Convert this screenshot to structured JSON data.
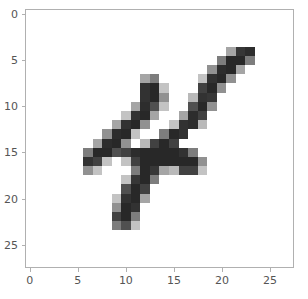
{
  "figure": {
    "background_color": "#ffffff",
    "axes_edge_color": "#b0b0b0",
    "tick_color": "#555555"
  },
  "chart_data": {
    "type": "heatmap",
    "title": "",
    "xlabel": "",
    "ylabel": "",
    "colormap": "gray_r",
    "origin": "upper",
    "grid": false,
    "legend": null,
    "interpolation": "nearest",
    "aspect": "equal",
    "vmin": 0,
    "vmax": 255,
    "shape": [
      28,
      28
    ],
    "xlim": [
      -0.5,
      27.5
    ],
    "ylim": [
      27.5,
      -0.5
    ],
    "xticks": [
      0,
      5,
      10,
      15,
      20,
      25
    ],
    "yticks": [
      0,
      5,
      10,
      15,
      20,
      25
    ],
    "xticklabels": [
      "0",
      "5",
      "10",
      "15",
      "20",
      "25"
    ],
    "yticklabels": [
      "0",
      "5",
      "10",
      "15",
      "20",
      "25"
    ],
    "values": [
      [
        0,
        0,
        0,
        0,
        0,
        0,
        0,
        0,
        0,
        0,
        0,
        0,
        0,
        0,
        0,
        0,
        0,
        0,
        0,
        0,
        0,
        0,
        0,
        0,
        0,
        0,
        0,
        0
      ],
      [
        0,
        0,
        0,
        0,
        0,
        0,
        0,
        0,
        0,
        0,
        0,
        0,
        0,
        0,
        0,
        0,
        0,
        0,
        0,
        0,
        0,
        0,
        0,
        0,
        0,
        0,
        0,
        0
      ],
      [
        0,
        0,
        0,
        0,
        0,
        0,
        0,
        0,
        0,
        0,
        0,
        0,
        0,
        0,
        0,
        0,
        0,
        0,
        0,
        0,
        0,
        0,
        0,
        0,
        0,
        0,
        0,
        0
      ],
      [
        0,
        0,
        0,
        0,
        0,
        0,
        0,
        0,
        0,
        0,
        0,
        0,
        0,
        0,
        0,
        0,
        0,
        0,
        0,
        0,
        0,
        0,
        0,
        0,
        0,
        0,
        0,
        0
      ],
      [
        0,
        0,
        0,
        0,
        0,
        0,
        0,
        0,
        0,
        0,
        0,
        0,
        0,
        0,
        0,
        0,
        0,
        0,
        0,
        0,
        0,
        90,
        200,
        210,
        0,
        0,
        0,
        0
      ],
      [
        0,
        0,
        0,
        0,
        0,
        0,
        0,
        0,
        0,
        0,
        0,
        0,
        0,
        0,
        0,
        0,
        0,
        0,
        0,
        0,
        130,
        215,
        215,
        130,
        0,
        0,
        0,
        0
      ],
      [
        0,
        0,
        0,
        0,
        0,
        0,
        0,
        0,
        0,
        0,
        0,
        0,
        0,
        0,
        0,
        0,
        0,
        0,
        0,
        110,
        210,
        215,
        90,
        0,
        0,
        0,
        0,
        0
      ],
      [
        0,
        0,
        0,
        0,
        0,
        0,
        0,
        0,
        0,
        0,
        0,
        0,
        90,
        130,
        0,
        0,
        0,
        0,
        60,
        205,
        215,
        110,
        0,
        0,
        0,
        0,
        0,
        0
      ],
      [
        0,
        0,
        0,
        0,
        0,
        0,
        0,
        0,
        0,
        0,
        0,
        0,
        205,
        215,
        60,
        0,
        0,
        0,
        190,
        215,
        110,
        0,
        0,
        0,
        0,
        0,
        0,
        0
      ],
      [
        0,
        0,
        0,
        0,
        0,
        0,
        0,
        0,
        0,
        0,
        0,
        0,
        205,
        215,
        110,
        0,
        0,
        70,
        205,
        200,
        0,
        0,
        0,
        0,
        0,
        0,
        0,
        0
      ],
      [
        0,
        0,
        0,
        0,
        0,
        0,
        0,
        0,
        0,
        0,
        0,
        90,
        210,
        175,
        60,
        0,
        0,
        175,
        215,
        110,
        0,
        0,
        0,
        0,
        0,
        0,
        0,
        0
      ],
      [
        0,
        0,
        0,
        0,
        0,
        0,
        0,
        0,
        0,
        0,
        60,
        205,
        215,
        90,
        0,
        0,
        90,
        210,
        190,
        0,
        0,
        0,
        0,
        0,
        0,
        0,
        0,
        0
      ],
      [
        0,
        0,
        0,
        0,
        0,
        0,
        0,
        0,
        0,
        90,
        205,
        215,
        110,
        0,
        0,
        60,
        205,
        210,
        70,
        0,
        0,
        0,
        0,
        0,
        0,
        0,
        0,
        0
      ],
      [
        0,
        0,
        0,
        0,
        0,
        0,
        0,
        0,
        110,
        210,
        215,
        60,
        0,
        0,
        130,
        215,
        205,
        0,
        0,
        0,
        0,
        0,
        0,
        0,
        0,
        0,
        0,
        0
      ],
      [
        0,
        0,
        0,
        0,
        0,
        0,
        0,
        90,
        210,
        215,
        110,
        0,
        70,
        190,
        215,
        190,
        0,
        0,
        0,
        0,
        0,
        0,
        0,
        0,
        0,
        0,
        0,
        0
      ],
      [
        0,
        0,
        0,
        0,
        0,
        0,
        130,
        215,
        215,
        175,
        190,
        210,
        215,
        215,
        215,
        215,
        205,
        130,
        0,
        0,
        0,
        0,
        0,
        0,
        0,
        0,
        0,
        0
      ],
      [
        0,
        0,
        0,
        0,
        0,
        0,
        205,
        190,
        60,
        0,
        60,
        190,
        215,
        215,
        215,
        215,
        215,
        215,
        110,
        0,
        0,
        0,
        0,
        0,
        0,
        0,
        0,
        0
      ],
      [
        0,
        0,
        0,
        0,
        0,
        0,
        110,
        60,
        0,
        0,
        0,
        130,
        215,
        200,
        90,
        70,
        190,
        190,
        60,
        0,
        0,
        0,
        0,
        0,
        0,
        0,
        0,
        0
      ],
      [
        0,
        0,
        0,
        0,
        0,
        0,
        0,
        0,
        0,
        0,
        60,
        200,
        215,
        130,
        0,
        0,
        0,
        0,
        0,
        0,
        0,
        0,
        0,
        0,
        0,
        0,
        0,
        0
      ],
      [
        0,
        0,
        0,
        0,
        0,
        0,
        0,
        0,
        0,
        0,
        175,
        215,
        190,
        0,
        0,
        0,
        0,
        0,
        0,
        0,
        0,
        0,
        0,
        0,
        0,
        0,
        0,
        0
      ],
      [
        0,
        0,
        0,
        0,
        0,
        0,
        0,
        0,
        0,
        60,
        205,
        215,
        90,
        0,
        0,
        0,
        0,
        0,
        0,
        0,
        0,
        0,
        0,
        0,
        0,
        0,
        0,
        0
      ],
      [
        0,
        0,
        0,
        0,
        0,
        0,
        0,
        0,
        0,
        110,
        215,
        205,
        0,
        0,
        0,
        0,
        0,
        0,
        0,
        0,
        0,
        0,
        0,
        0,
        0,
        0,
        0,
        0
      ],
      [
        0,
        0,
        0,
        0,
        0,
        0,
        0,
        0,
        0,
        190,
        215,
        130,
        0,
        0,
        0,
        0,
        0,
        0,
        0,
        0,
        0,
        0,
        0,
        0,
        0,
        0,
        0,
        0
      ],
      [
        0,
        0,
        0,
        0,
        0,
        0,
        0,
        0,
        0,
        130,
        175,
        60,
        0,
        0,
        0,
        0,
        0,
        0,
        0,
        0,
        0,
        0,
        0,
        0,
        0,
        0,
        0,
        0
      ],
      [
        0,
        0,
        0,
        0,
        0,
        0,
        0,
        0,
        0,
        0,
        0,
        0,
        0,
        0,
        0,
        0,
        0,
        0,
        0,
        0,
        0,
        0,
        0,
        0,
        0,
        0,
        0,
        0
      ],
      [
        0,
        0,
        0,
        0,
        0,
        0,
        0,
        0,
        0,
        0,
        0,
        0,
        0,
        0,
        0,
        0,
        0,
        0,
        0,
        0,
        0,
        0,
        0,
        0,
        0,
        0,
        0,
        0
      ],
      [
        0,
        0,
        0,
        0,
        0,
        0,
        0,
        0,
        0,
        0,
        0,
        0,
        0,
        0,
        0,
        0,
        0,
        0,
        0,
        0,
        0,
        0,
        0,
        0,
        0,
        0,
        0,
        0
      ],
      [
        0,
        0,
        0,
        0,
        0,
        0,
        0,
        0,
        0,
        0,
        0,
        0,
        0,
        0,
        0,
        0,
        0,
        0,
        0,
        0,
        0,
        0,
        0,
        0,
        0,
        0,
        0,
        0
      ]
    ]
  }
}
